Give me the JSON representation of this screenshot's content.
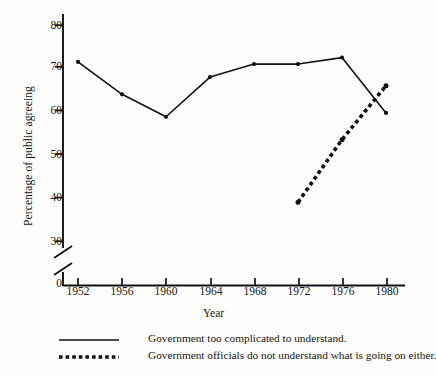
{
  "chart_data": {
    "type": "line",
    "title": "",
    "xlabel": "Year",
    "ylabel": "Percentage of public agreeing",
    "categories": [
      1952,
      1956,
      1960,
      1964,
      1968,
      1972,
      1976,
      1980
    ],
    "xticklabels": [
      "1952",
      "1956",
      "1960",
      "1964",
      "1968",
      "1972",
      "1976",
      "1980"
    ],
    "yticklabels": [
      "0",
      "30",
      "40",
      "50",
      "60",
      "70",
      "80"
    ],
    "yticks": [
      0,
      30,
      40,
      50,
      60,
      70,
      80
    ],
    "ylim": [
      30,
      84
    ],
    "xlim": [
      1950,
      1982
    ],
    "axis_break": true,
    "axis_break_note": "y-axis broken between 0 and 30",
    "grid": false,
    "legend_position": "below-plot",
    "series": [
      {
        "name": "Government too complicated to understand.",
        "style": "solid",
        "color": "#111111",
        "marker": "dot",
        "x": [
          1952,
          1956,
          1960,
          1964,
          1968,
          1972,
          1976,
          1980
        ],
        "values": [
          71.5,
          64.0,
          58.8,
          68.0,
          71.0,
          71.0,
          72.5,
          59.7
        ]
      },
      {
        "name": "Government officials do not understand what is going on either.",
        "style": "dotted",
        "color": "#111111",
        "marker": "dot",
        "x": [
          1972,
          1976,
          1980
        ],
        "values": [
          39.0,
          53.5,
          66.0
        ]
      }
    ]
  },
  "legend": {
    "items": [
      {
        "label": "Government too complicated to understand.",
        "style": "solid"
      },
      {
        "label": "Government officials do not understand what is going on either.",
        "style": "dotted"
      }
    ]
  },
  "colors": {
    "ink": "#111111",
    "background": "#fdfdfb"
  }
}
